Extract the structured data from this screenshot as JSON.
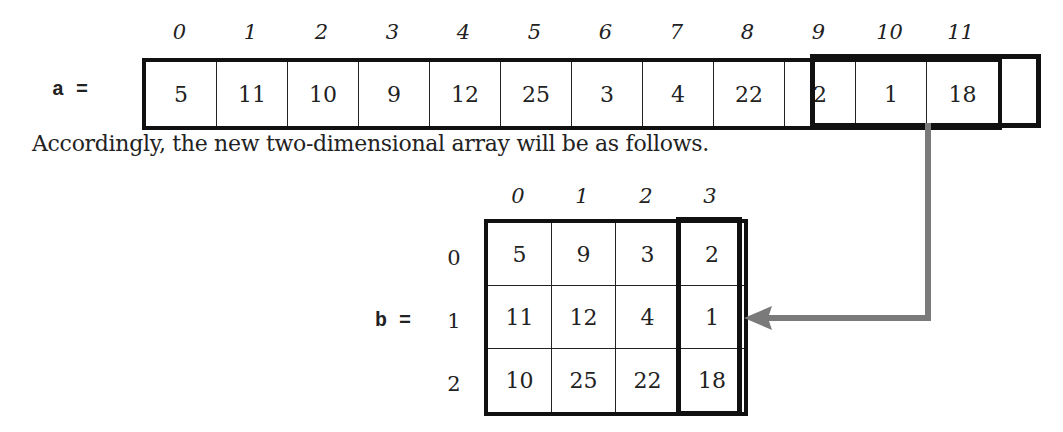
{
  "array_a": {
    "label": "a =",
    "indices": [
      "0",
      "1",
      "2",
      "3",
      "4",
      "5",
      "6",
      "7",
      "8",
      "9",
      "10",
      "11"
    ],
    "values": [
      "5",
      "11",
      "10",
      "9",
      "12",
      "25",
      "3",
      "4",
      "22",
      "2",
      "1",
      "18"
    ],
    "highlighted_range": [
      9,
      11
    ]
  },
  "sentence": "Accordingly, the new two-dimensional array will be as follows.",
  "matrix_b": {
    "label": "b =",
    "col_indices": [
      "0",
      "1",
      "2",
      "3"
    ],
    "row_indices": [
      "0",
      "1",
      "2"
    ],
    "rows": [
      [
        "5",
        "9",
        "3",
        "2"
      ],
      [
        "11",
        "12",
        "4",
        "1"
      ],
      [
        "10",
        "25",
        "22",
        "18"
      ]
    ],
    "highlighted_column": 3
  },
  "arrow": {
    "from": "a[9..11]",
    "to": "b column 3",
    "color": "#7a7a7a"
  }
}
